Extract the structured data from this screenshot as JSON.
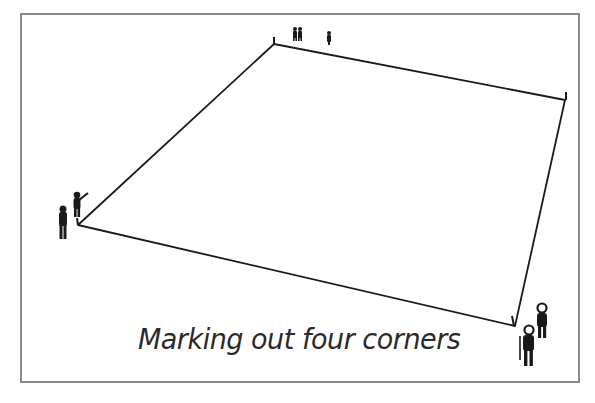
{
  "figure": {
    "caption": "Marking out four corners",
    "colors": {
      "ink": "#1a1a1a",
      "frame": "#8a8a8a",
      "background": "#ffffff"
    },
    "corners": [
      {
        "name": "top-left",
        "x": 274,
        "y": 44
      },
      {
        "name": "top-right",
        "x": 565,
        "y": 100
      },
      {
        "name": "bottom-right",
        "x": 515,
        "y": 326
      },
      {
        "name": "bottom-left",
        "x": 78,
        "y": 225
      }
    ],
    "figures": [
      {
        "group": "top",
        "count": 3
      },
      {
        "group": "left",
        "count": 2
      },
      {
        "group": "bottom-right",
        "count": 2
      }
    ]
  }
}
